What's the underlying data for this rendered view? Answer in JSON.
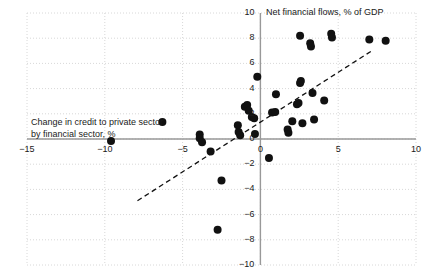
{
  "chart_data": {
    "type": "scatter",
    "title": "Net financial flows, % of GDP",
    "xlabel": "Change in credit to private sector\nby financial  sector, %",
    "ylabel": "",
    "xlim": [
      -15,
      10
    ],
    "ylim": [
      -10,
      10
    ],
    "xticks": [
      -15,
      -10,
      -5,
      0,
      5,
      10
    ],
    "yticks": [
      -10,
      -8,
      -6,
      -4,
      -2,
      0,
      2,
      4,
      6,
      8,
      10
    ],
    "xtick_labels": [
      "−15",
      "−10",
      "−5",
      "0",
      "5",
      "10"
    ],
    "ytick_labels": [
      "−10",
      "−8",
      "−6",
      "−4",
      "−2",
      "0",
      "2",
      "4",
      "6",
      "8",
      "10"
    ],
    "grid": true,
    "grid_style": "dotted",
    "grid_color": "#d8d8d8",
    "axis_color": "#999999",
    "marker_color": "#111111",
    "marker_size": 4.0,
    "legend": "none",
    "trendline": {
      "style": "dashed",
      "color": "#111111",
      "x_start": -7.9,
      "y_start": -4.9,
      "x_end": 7.1,
      "y_end": 6.95
    },
    "points": [
      {
        "x": -9.6,
        "y": -0.15
      },
      {
        "x": -6.3,
        "y": 1.35
      },
      {
        "x": -3.9,
        "y": 0.35
      },
      {
        "x": -3.9,
        "y": 0.05
      },
      {
        "x": -3.75,
        "y": -0.25
      },
      {
        "x": -3.2,
        "y": -1.0
      },
      {
        "x": -2.5,
        "y": -3.3
      },
      {
        "x": -2.75,
        "y": -7.2
      },
      {
        "x": -1.45,
        "y": 1.1
      },
      {
        "x": -1.4,
        "y": 0.55
      },
      {
        "x": -1.3,
        "y": 0.3
      },
      {
        "x": -1.0,
        "y": 2.55
      },
      {
        "x": -0.85,
        "y": 2.7
      },
      {
        "x": -0.75,
        "y": 2.25
      },
      {
        "x": -0.55,
        "y": 1.75
      },
      {
        "x": -0.4,
        "y": 1.65
      },
      {
        "x": -0.35,
        "y": 0.4
      },
      {
        "x": -0.2,
        "y": 4.95
      },
      {
        "x": 0.55,
        "y": -1.5
      },
      {
        "x": 0.75,
        "y": 2.1
      },
      {
        "x": 0.95,
        "y": 2.15
      },
      {
        "x": 1.0,
        "y": 3.55
      },
      {
        "x": 1.75,
        "y": 0.75
      },
      {
        "x": 1.8,
        "y": 0.5
      },
      {
        "x": 2.05,
        "y": 1.4
      },
      {
        "x": 2.35,
        "y": 2.75
      },
      {
        "x": 2.45,
        "y": 2.85
      },
      {
        "x": 2.55,
        "y": 4.45
      },
      {
        "x": 2.6,
        "y": 4.6
      },
      {
        "x": 2.7,
        "y": 1.25
      },
      {
        "x": 2.55,
        "y": 8.2
      },
      {
        "x": 3.2,
        "y": 7.6
      },
      {
        "x": 3.25,
        "y": 7.35
      },
      {
        "x": 3.35,
        "y": 3.65
      },
      {
        "x": 3.45,
        "y": 1.55
      },
      {
        "x": 4.1,
        "y": 3.05
      },
      {
        "x": 4.55,
        "y": 8.35
      },
      {
        "x": 4.6,
        "y": 8.05
      },
      {
        "x": 7.0,
        "y": 7.9
      },
      {
        "x": 8.05,
        "y": 7.8
      }
    ]
  }
}
